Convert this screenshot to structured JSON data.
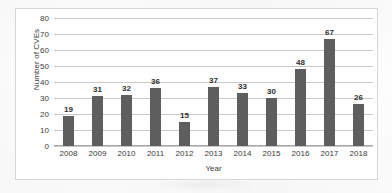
{
  "chart_data": {
    "type": "bar",
    "title": "",
    "xlabel": "Year",
    "ylabel": "Number of CVEs",
    "categories": [
      "2008",
      "2009",
      "2010",
      "2011",
      "2012",
      "2013",
      "2014",
      "2015",
      "2016",
      "2017",
      "2018"
    ],
    "values": [
      19,
      31,
      32,
      36,
      15,
      37,
      33,
      30,
      48,
      67,
      26
    ],
    "data_labels": [
      "19",
      "31",
      "32",
      "36",
      "15",
      "37",
      "33",
      "30",
      "48",
      "67",
      "26"
    ],
    "ylim": [
      0,
      80
    ],
    "ytick_step": 10,
    "yticks": [
      "0",
      "10",
      "20",
      "30",
      "40",
      "50",
      "60",
      "70",
      "80"
    ],
    "grid": true,
    "grid_axis": "y",
    "legend": "none",
    "bar_color": "#5e5e5e",
    "gridline_color": "#c9c9c9",
    "axis_color": "#a8a8a8",
    "text_color": "#3c3c3c",
    "plot_border_color": "#d6d6d6",
    "background_color": "#fdfdfd"
  }
}
